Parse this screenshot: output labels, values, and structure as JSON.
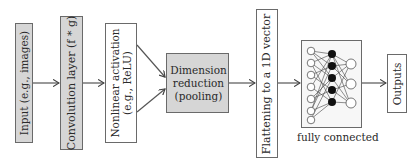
{
  "diagram": {
    "stages": [
      {
        "id": "input",
        "label": "Input (e.g., images)",
        "fill": "#d6d6d6"
      },
      {
        "id": "conv",
        "label": "Convolution layer (f * g)",
        "fill": "#d6d6d6"
      },
      {
        "id": "activation",
        "label_line1": "Nonlinear activation",
        "label_line2": "(e.g., ReLU)",
        "fill": "#ffffff"
      },
      {
        "id": "pooling",
        "label_line1": "Dimension",
        "label_line2": "reduction",
        "label_line3": "(pooling)",
        "fill": "#d6d6d6"
      },
      {
        "id": "flatten",
        "label": "Flattening to a 1D vector",
        "fill": "#ffffff"
      },
      {
        "id": "fc",
        "caption": "fully connected",
        "fill": "#ffffff"
      },
      {
        "id": "outputs",
        "label": "Outputs",
        "fill": "#ffffff"
      }
    ],
    "fc_network": {
      "input_nodes": 7,
      "hidden_nodes": 5,
      "output_nodes": 3,
      "hidden_fill": "#111111",
      "open_fill": "#ffffff"
    },
    "colors": {
      "edge": "#555555",
      "box_border": "#6a6a6a",
      "gray_fill": "#d6d6d6"
    }
  }
}
